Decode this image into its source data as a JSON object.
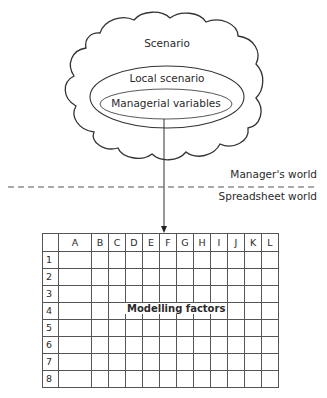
{
  "diagram": {
    "cloud": {
      "label": "Scenario"
    },
    "outer_ellipse": {
      "label": "Local scenario"
    },
    "inner_ellipse": {
      "label": "Managerial variables"
    },
    "divider": {
      "upper_label": "Manager's world",
      "lower_label": "Spreadsheet world",
      "style": "dashed"
    },
    "arrow": {
      "from": "Managerial variables",
      "to": "Spreadsheet"
    },
    "spreadsheet": {
      "columns": [
        "A",
        "B",
        "C",
        "D",
        "E",
        "F",
        "G",
        "H",
        "I",
        "J",
        "K",
        "L"
      ],
      "rows": [
        "1",
        "2",
        "3",
        "4",
        "5",
        "6",
        "7",
        "8"
      ],
      "overlay_label": "Modelling factors",
      "overlay_row": "4"
    }
  }
}
